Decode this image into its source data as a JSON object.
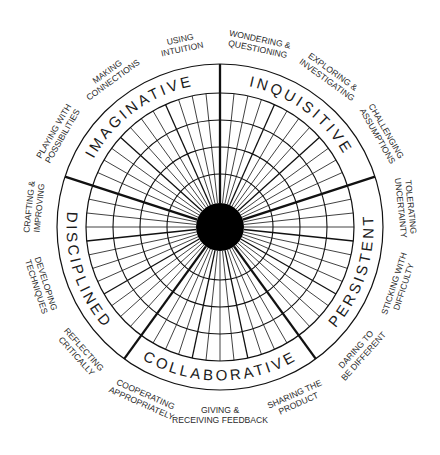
{
  "diagram": {
    "center": {
      "x": 220,
      "y": 227
    },
    "radii": {
      "outer": 163,
      "grid": 134,
      "rings": [
        107,
        80,
        53
      ],
      "hub": 24
    },
    "colors": {
      "line": "#111111",
      "hub": "#000000",
      "text": "#1a1a1a",
      "background": "#ffffff"
    },
    "spoke_step_deg": 6,
    "dimensions": [
      {
        "id": "imaginative",
        "label": "IMAGINATIVE",
        "start_deg": -162,
        "end_deg": -90,
        "habits": [
          "PLAYING WITH POSSIBILITIES",
          "MAKING CONNECTIONS",
          "USING INTUITION"
        ]
      },
      {
        "id": "inquisitive",
        "label": "INQUISITIVE",
        "start_deg": -90,
        "end_deg": -18,
        "habits": [
          "WONDERING & QUESTIONING",
          "EXPLORING & INVESTIGATING",
          "CHALLENGING ASSUMPTIONS"
        ]
      },
      {
        "id": "persistent",
        "label": "PERSISTENT",
        "start_deg": -18,
        "end_deg": 54,
        "habits": [
          "TOLERATING UNCERTAINTY",
          "STICKING WITH DIFFICULTY",
          "DARING TO BE DIFFERENT"
        ]
      },
      {
        "id": "collaborative",
        "label": "COLLABORATIVE",
        "start_deg": 54,
        "end_deg": 126,
        "habits": [
          "SHARING THE PRODUCT",
          "GIVING & RECEIVING FEEDBACK",
          "COOPERATING APPROPRIATELY"
        ]
      },
      {
        "id": "disciplined",
        "label": "DISCIPLINED",
        "start_deg": 126,
        "end_deg": 198,
        "habits": [
          "REFLECTING CRITICALLY",
          "DEVELOPING TECHNIQUES",
          "CRAFTING & IMPROVING"
        ]
      }
    ],
    "habit_label_lines": {
      "PLAYING WITH POSSIBILITIES": [
        "PLAYING WITH",
        "POSSIBILITIES"
      ],
      "MAKING CONNECTIONS": [
        "MAKING",
        "CONNECTIONS"
      ],
      "USING INTUITION": [
        "USING",
        "INTUITION"
      ],
      "WONDERING & QUESTIONING": [
        "WONDERING &",
        "QUESTIONING"
      ],
      "EXPLORING & INVESTIGATING": [
        "EXPLORING &",
        "INVESTIGATING"
      ],
      "CHALLENGING ASSUMPTIONS": [
        "CHALLENGING",
        "ASSUMPTIONS"
      ],
      "TOLERATING UNCERTAINTY": [
        "TOLERATING",
        "UNCERTAINTY"
      ],
      "STICKING WITH DIFFICULTY": [
        "STICKING WITH",
        "DIFFICULTY"
      ],
      "DARING TO BE DIFFERENT": [
        "DARING TO",
        "BE DIFFERENT"
      ],
      "SHARING THE PRODUCT": [
        "SHARING THE",
        "PRODUCT"
      ],
      "GIVING & RECEIVING FEEDBACK": [
        "GIVING &",
        "RECEIVING FEEDBACK"
      ],
      "COOPERATING APPROPRIATELY": [
        "COOPERATING",
        "APPROPRIATELY"
      ],
      "REFLECTING CRITICALLY": [
        "REFLECTING",
        "CRITICALLY"
      ],
      "DEVELOPING TECHNIQUES": [
        "DEVELOPING",
        "TECHNIQUES"
      ],
      "CRAFTING & IMPROVING": [
        "CRAFTING &",
        "IMPROVING"
      ]
    }
  }
}
